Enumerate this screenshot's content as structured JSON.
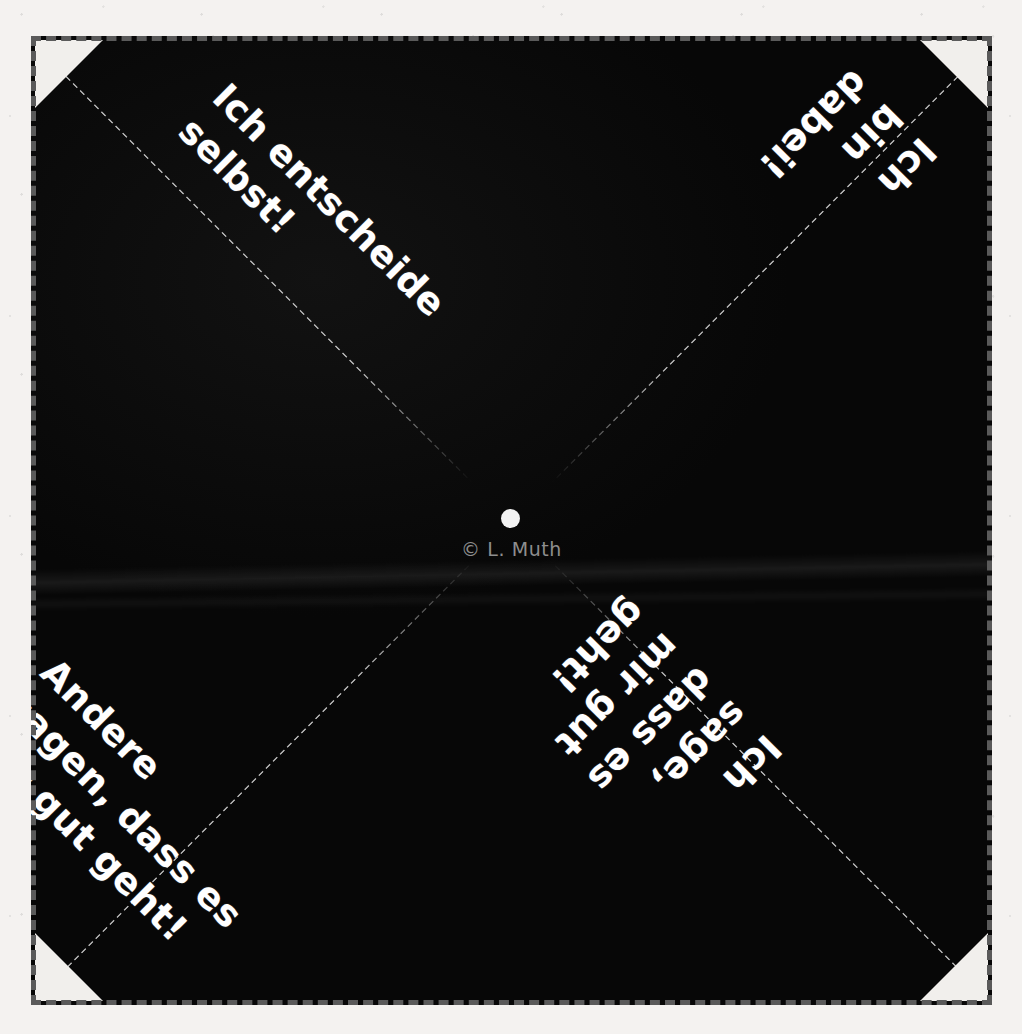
{
  "document": {
    "type": "fortune-teller-template",
    "language": "de",
    "credit": "© L. Muth"
  },
  "quadrants": [
    {
      "id": "top-left",
      "text": "Ich entscheide\nselbst!",
      "rotation_deg": 45
    },
    {
      "id": "top-right",
      "text": "Ich bin dabei!",
      "rotation_deg": 135
    },
    {
      "id": "bottom-left",
      "text": "Andere\nsagen, dass es\nmir gut geht!",
      "rotation_deg": 45
    },
    {
      "id": "bottom-right",
      "text": "Ich\nsage, dass es\nmir gut geht!",
      "rotation_deg": 135
    }
  ],
  "colors": {
    "paper": "#f4f2f0",
    "ink": "#0a0a0a",
    "text": "#ffffff",
    "cut_line": "#5a5a5a",
    "fold_line": "#c9c9c9",
    "credit_text": "#8e8e8e",
    "corner_flap": "#f1efec"
  },
  "marks": {
    "centre_dot": "centre-dot",
    "cut_border_style": "dashed",
    "fold_line_style": "dashed",
    "corner_count": 4
  }
}
